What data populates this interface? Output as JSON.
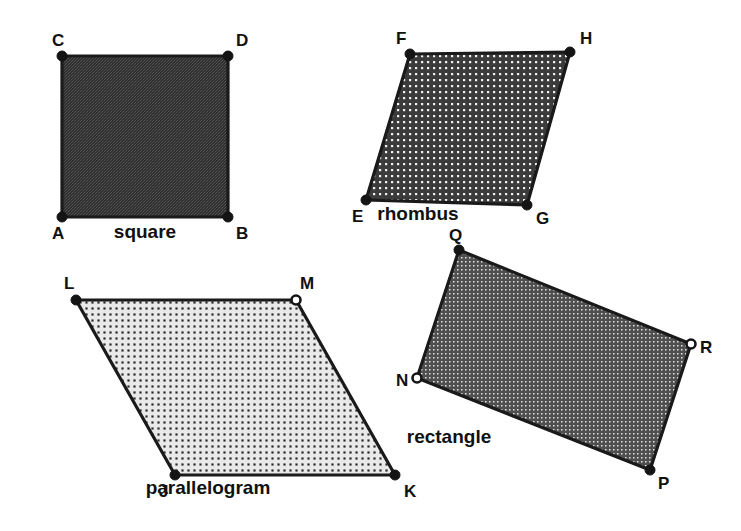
{
  "figure": {
    "background_color": "#ffffff",
    "stroke_color": "#1a1a1a",
    "width": 741,
    "height": 531
  },
  "shapes": [
    {
      "id": "square",
      "name": "square",
      "name_label_x": 145,
      "name_label_y": 238,
      "fill_pattern": "dense-dark-weave",
      "fill_color": "#3a3a3a",
      "points": "62,56 228,56 228,217 62,217",
      "vertices": [
        {
          "label": "C",
          "x": 62,
          "y": 56,
          "marker": "filled",
          "label_x": 52,
          "label_y": 46
        },
        {
          "label": "D",
          "x": 228,
          "y": 56,
          "marker": "filled",
          "label_x": 236,
          "label_y": 46
        },
        {
          "label": "A",
          "x": 62,
          "y": 217,
          "marker": "filled",
          "label_x": 52,
          "label_y": 239
        },
        {
          "label": "B",
          "x": 228,
          "y": 217,
          "marker": "filled",
          "label_x": 236,
          "label_y": 239
        }
      ]
    },
    {
      "id": "rhombus",
      "name": "rhombus",
      "name_label_x": 418,
      "name_label_y": 220,
      "fill_pattern": "medium-dot-grid",
      "fill_color": "#4d4d4d",
      "points": "410,54 570,52 527,205 366,200",
      "vertices": [
        {
          "label": "F",
          "x": 410,
          "y": 54,
          "marker": "filled",
          "label_x": 396,
          "label_y": 44
        },
        {
          "label": "H",
          "x": 570,
          "y": 52,
          "marker": "filled",
          "label_x": 580,
          "label_y": 44
        },
        {
          "label": "E",
          "x": 366,
          "y": 200,
          "marker": "filled",
          "label_x": 352,
          "label_y": 222
        },
        {
          "label": "G",
          "x": 527,
          "y": 205,
          "marker": "filled",
          "label_x": 536,
          "label_y": 224
        }
      ]
    },
    {
      "id": "parallelogram",
      "name": "parallelogram",
      "name_label_x": 208,
      "name_label_y": 494,
      "fill_pattern": "light-dot-grid",
      "fill_color": "#d8d8d8",
      "points": "76,300 296,300 395,475 175,475",
      "vertices": [
        {
          "label": "L",
          "x": 76,
          "y": 300,
          "marker": "filled",
          "label_x": 64,
          "label_y": 289
        },
        {
          "label": "M",
          "x": 296,
          "y": 300,
          "marker": "open",
          "label_x": 300,
          "label_y": 289
        },
        {
          "label": "J",
          "x": 175,
          "y": 475,
          "marker": "filled",
          "label_x": 159,
          "label_y": 497
        },
        {
          "label": "K",
          "x": 395,
          "y": 475,
          "marker": "filled",
          "label_x": 404,
          "label_y": 497
        }
      ]
    },
    {
      "id": "rectangle",
      "name": "rectangle",
      "name_label_x": 449,
      "name_label_y": 443,
      "fill_pattern": "medium-fine-dot",
      "fill_color": "#636363",
      "points": "459,250 691,344 650,470 417,378",
      "vertices": [
        {
          "label": "Q",
          "x": 459,
          "y": 250,
          "marker": "filled",
          "label_x": 449,
          "label_y": 241
        },
        {
          "label": "R",
          "x": 691,
          "y": 344,
          "marker": "open",
          "label_x": 700,
          "label_y": 353
        },
        {
          "label": "N",
          "x": 417,
          "y": 378,
          "marker": "open",
          "label_x": 396,
          "label_y": 386
        },
        {
          "label": "P",
          "x": 650,
          "y": 470,
          "marker": "filled",
          "label_x": 658,
          "label_y": 489
        }
      ]
    }
  ]
}
